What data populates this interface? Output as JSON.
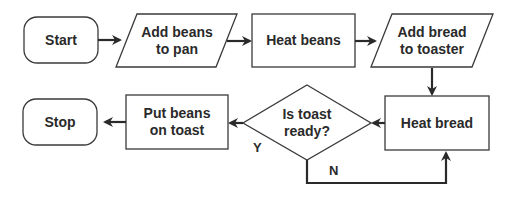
{
  "diagram": {
    "type": "flowchart",
    "colors": {
      "stroke": "#3a3a3a",
      "text": "#2a2a2a",
      "background": "#ffffff"
    },
    "nodes": [
      {
        "id": "start",
        "shape": "terminator",
        "label": "Start"
      },
      {
        "id": "add_beans",
        "shape": "parallelogram",
        "label": "Add beans\nto pan"
      },
      {
        "id": "heat_beans",
        "shape": "rectangle",
        "label": "Heat beans"
      },
      {
        "id": "add_bread",
        "shape": "parallelogram",
        "label": "Add bread\nto toaster"
      },
      {
        "id": "heat_bread",
        "shape": "rectangle",
        "label": "Heat bread"
      },
      {
        "id": "is_ready",
        "shape": "diamond",
        "label": "Is toast\nready?"
      },
      {
        "id": "put_beans",
        "shape": "rectangle",
        "label": "Put beans\non toast"
      },
      {
        "id": "stop",
        "shape": "terminator",
        "label": "Stop"
      }
    ],
    "edges": [
      {
        "from": "start",
        "to": "add_beans",
        "label": ""
      },
      {
        "from": "add_beans",
        "to": "heat_beans",
        "label": ""
      },
      {
        "from": "heat_beans",
        "to": "add_bread",
        "label": ""
      },
      {
        "from": "add_bread",
        "to": "heat_bread",
        "label": ""
      },
      {
        "from": "heat_bread",
        "to": "is_ready",
        "label": ""
      },
      {
        "from": "is_ready",
        "to": "put_beans",
        "label": "Y"
      },
      {
        "from": "is_ready",
        "to": "heat_bread",
        "label": "N"
      },
      {
        "from": "put_beans",
        "to": "stop",
        "label": ""
      }
    ],
    "edge_labels": {
      "yes": "Y",
      "no": "N"
    }
  }
}
